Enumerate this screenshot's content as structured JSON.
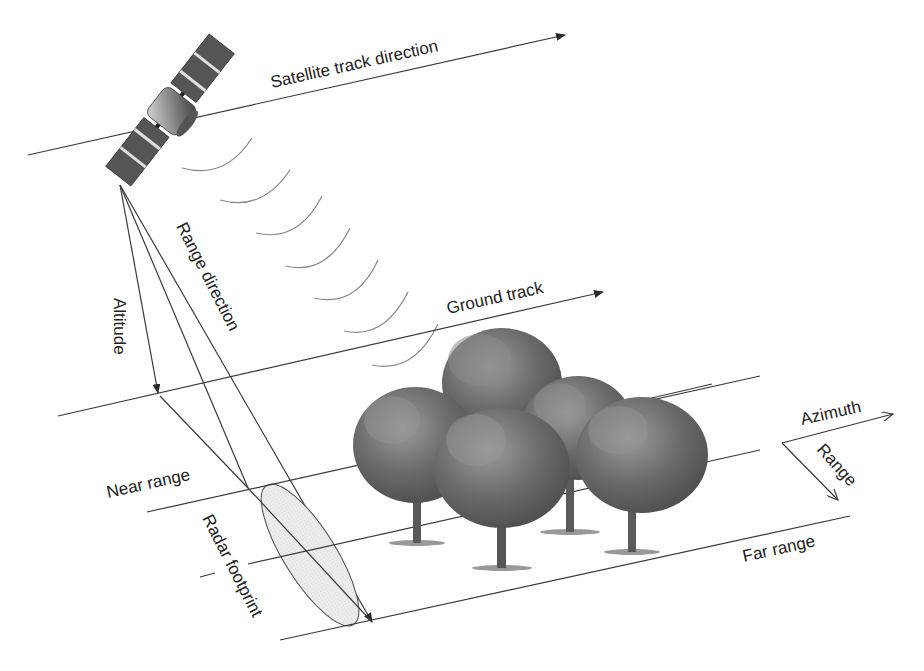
{
  "diagram": {
    "labels": {
      "satellite_track": "Satellite track direction",
      "range_direction": "Range direction",
      "altitude": "Altitude",
      "ground_track": "Ground track",
      "azimuth": "Azimuth",
      "range": "Range",
      "near_range": "Near range",
      "far_range": "Far range",
      "radar_footprint": "Radar footprint"
    },
    "icons": [
      "satellite-icon",
      "radar-wave-icon",
      "tree-icon",
      "arrow-icon"
    ],
    "colors": {
      "line": "#3a3a3a",
      "wave": "#888888",
      "footprint_fill": "#e6e6e6",
      "tree_dark": "#555555",
      "tree_light": "#9a9a9a"
    },
    "tree_count": 5,
    "wave_count": 7
  }
}
